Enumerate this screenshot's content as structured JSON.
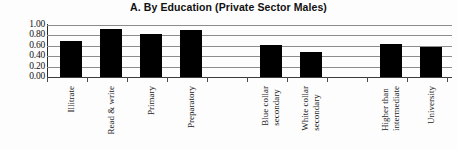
{
  "chart_data": {
    "type": "bar",
    "title": "A. By Education (Private Sector Males)",
    "xlabel": "",
    "ylabel": "",
    "ylim": [
      0.0,
      1.0
    ],
    "ytick_labels": [
      "1.00",
      "0.80",
      "0.60",
      "0.40",
      "0.20",
      "0.00"
    ],
    "ytick_values": [
      1.0,
      0.8,
      0.6,
      0.4,
      0.2,
      0.0
    ],
    "grid": true,
    "legend": "none",
    "bar_color": "#000000",
    "categories": [
      "Illitrate",
      "Read & write",
      "Primary",
      "Preparatory",
      "",
      "Blue collar secondary",
      "White collar secondary",
      "",
      "Higher than intermediate",
      "University"
    ],
    "values": [
      0.69,
      0.93,
      0.83,
      0.91,
      null,
      0.61,
      0.49,
      null,
      0.64,
      0.58
    ]
  },
  "bars": [
    {
      "label_line1": "Illitrate",
      "label_line2": "",
      "value": 0.69,
      "left": 13,
      "width": 22
    },
    {
      "label_line1": "Read & write",
      "label_line2": "",
      "value": 0.93,
      "left": 53,
      "width": 22
    },
    {
      "label_line1": "Primary",
      "label_line2": "",
      "value": 0.83,
      "left": 93,
      "width": 22
    },
    {
      "label_line1": "Preparatory",
      "label_line2": "",
      "value": 0.91,
      "left": 133,
      "width": 22
    },
    {
      "label_line1": "Blue collar",
      "label_line2": "secondary",
      "value": 0.61,
      "left": 213,
      "width": 22
    },
    {
      "label_line1": "White collar",
      "label_line2": "secondary",
      "value": 0.49,
      "left": 253,
      "width": 22
    },
    {
      "label_line1": "Higher than",
      "label_line2": "intermediate",
      "value": 0.64,
      "left": 333,
      "width": 22
    },
    {
      "label_line1": "University",
      "label_line2": "",
      "value": 0.58,
      "left": 373,
      "width": 22
    }
  ],
  "gridlines": [
    {
      "value": 1.0
    },
    {
      "value": 0.8
    },
    {
      "value": 0.6
    },
    {
      "value": 0.4
    },
    {
      "value": 0.2
    },
    {
      "value": 0.0
    }
  ],
  "xticks": [
    0,
    40,
    80,
    120,
    160,
    200,
    240,
    280,
    320,
    360,
    400
  ]
}
